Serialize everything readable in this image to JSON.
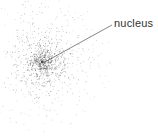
{
  "diagram": {
    "title": "",
    "labels": [
      {
        "text": "nucleus",
        "x": 114,
        "y": 17
      }
    ],
    "leader_line": {
      "from": [
        43,
        63
      ],
      "to": [
        112,
        25
      ],
      "color": "#555555"
    },
    "cloud": {
      "center": [
        42,
        62
      ],
      "dot_color": "#555555",
      "dense_radius": 12,
      "outer_radius": 62
    }
  }
}
